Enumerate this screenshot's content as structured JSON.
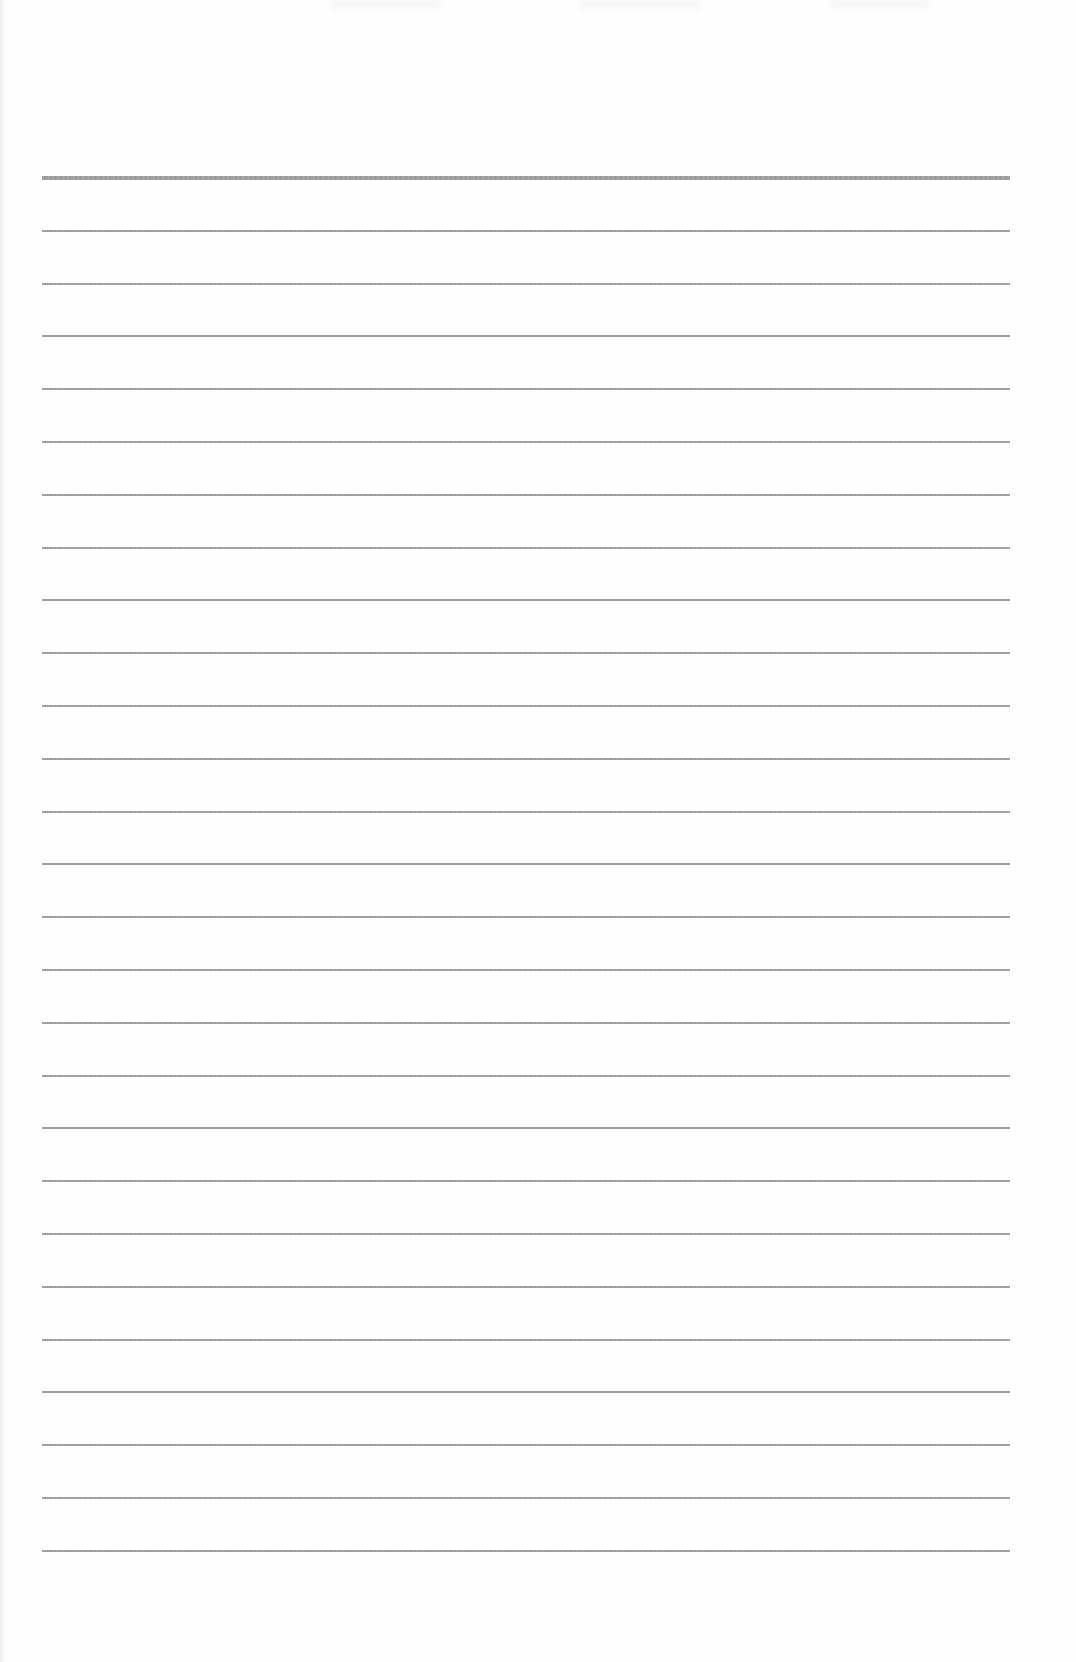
{
  "page": {
    "type": "lined-paper",
    "background_color": "#fefefe",
    "line_color": "#939393",
    "rules": {
      "count": 27,
      "first_y": 177,
      "spacing": 52.8,
      "left_x": 42,
      "right_x": 1010,
      "first_rule_thick": true
    }
  }
}
